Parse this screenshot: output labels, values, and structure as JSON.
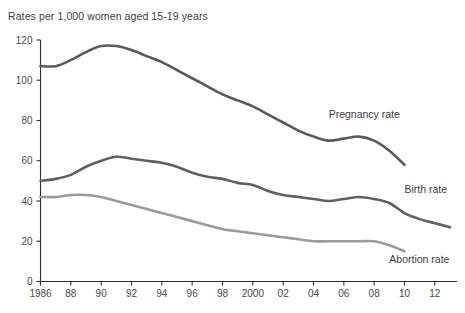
{
  "chart_data": {
    "type": "line",
    "title": "Rates per 1,000 women aged 15-19 years",
    "xlabel": "",
    "ylabel": "",
    "xlim": [
      1986,
      2013
    ],
    "ylim": [
      0,
      120
    ],
    "grid": false,
    "legend_position": "inline-right",
    "y_ticks": [
      "0",
      "20",
      "40",
      "60",
      "80",
      "100",
      "120"
    ],
    "y_tick_values": [
      0,
      20,
      40,
      60,
      80,
      100,
      120
    ],
    "x_ticks": [
      "1986",
      "88",
      "90",
      "92",
      "94",
      "96",
      "98",
      "2000",
      "02",
      "04",
      "06",
      "08",
      "10",
      "12"
    ],
    "x_tick_values": [
      1986,
      1988,
      1990,
      1992,
      1994,
      1996,
      1998,
      2000,
      2002,
      2004,
      2006,
      2008,
      2010,
      2012
    ],
    "series": [
      {
        "name": "Pregnancy rate",
        "color": "#5a5a5a",
        "label_x": 2005,
        "label_y": 81,
        "x": [
          1986,
          1987,
          1988,
          1989,
          1990,
          1991,
          1992,
          1993,
          1994,
          1995,
          1996,
          1997,
          1998,
          1999,
          2000,
          2001,
          2002,
          2003,
          2004,
          2005,
          2006,
          2007,
          2008,
          2009,
          2010
        ],
        "values": [
          107,
          107,
          110,
          114,
          117,
          117,
          115,
          112,
          109,
          105,
          101,
          97,
          93,
          90,
          87,
          83,
          79,
          75,
          72,
          70,
          71,
          72,
          70,
          65,
          58
        ]
      },
      {
        "name": "Birth rate",
        "color": "#606060",
        "label_x": 2010,
        "label_y": 44,
        "x": [
          1986,
          1987,
          1988,
          1989,
          1990,
          1991,
          1992,
          1993,
          1994,
          1995,
          1996,
          1997,
          1998,
          1999,
          2000,
          2001,
          2002,
          2003,
          2004,
          2005,
          2006,
          2007,
          2008,
          2009,
          2010,
          2011,
          2012,
          2013
        ],
        "values": [
          50,
          51,
          53,
          57,
          60,
          62,
          61,
          60,
          59,
          57,
          54,
          52,
          51,
          49,
          48,
          45,
          43,
          42,
          41,
          40,
          41,
          42,
          41,
          39,
          34,
          31,
          29,
          27
        ]
      },
      {
        "name": "Abortion rate",
        "color": "#9b9b9b",
        "label_x": 2009,
        "label_y": 9,
        "x": [
          1986,
          1987,
          1988,
          1989,
          1990,
          1991,
          1992,
          1993,
          1994,
          1995,
          1996,
          1997,
          1998,
          1999,
          2000,
          2001,
          2002,
          2003,
          2004,
          2005,
          2006,
          2007,
          2008,
          2009,
          2010
        ],
        "values": [
          42,
          42,
          43,
          43,
          42,
          40,
          38,
          36,
          34,
          32,
          30,
          28,
          26,
          25,
          24,
          23,
          22,
          21,
          20,
          20,
          20,
          20,
          20,
          18,
          15
        ]
      }
    ]
  }
}
